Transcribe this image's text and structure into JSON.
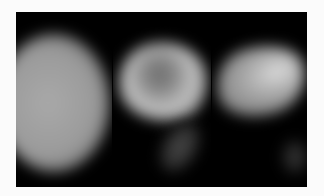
{
  "image": {
    "description": "Three grayscale scintigraphic panels on black background",
    "panels": [
      {
        "id": "panel-1",
        "content": "large round uniform uptake"
      },
      {
        "id": "panel-2",
        "content": "crescent-shaped uptake with photopenic center and faint inferior tail"
      },
      {
        "id": "panel-3",
        "content": "elongated oblique uptake with focal bright spot and faint inferior focus"
      }
    ],
    "colors": {
      "background": "#fbfbfb",
      "frame": "#000000"
    }
  }
}
